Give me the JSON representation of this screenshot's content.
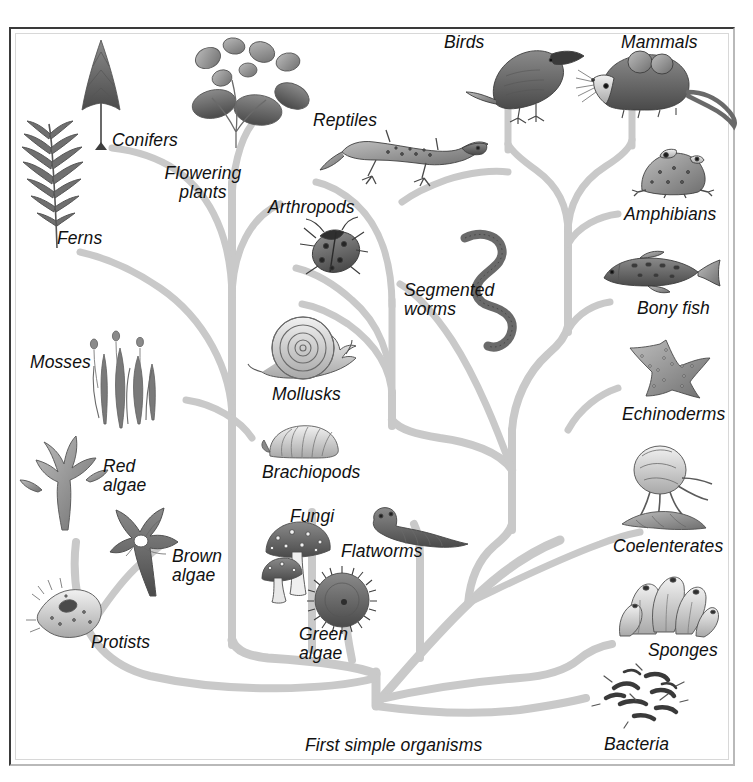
{
  "diagram": {
    "root_label": "First simple organisms",
    "background_color": "#ffffff",
    "branch_color": "#c9c9c9",
    "text_color": "#111111",
    "frame_color_dark": "#3a3a3a",
    "frame_color_light": "#b9b9b9"
  },
  "labels": [
    {
      "id": "conifers",
      "text": "Conifers",
      "x": 112,
      "y": 131,
      "align": "left"
    },
    {
      "id": "flowering",
      "text": "Flowering\nplants",
      "x": 148,
      "y": 164,
      "align": "left"
    },
    {
      "id": "ferns",
      "text": "Ferns",
      "x": 57,
      "y": 229,
      "align": "left"
    },
    {
      "id": "mosses",
      "text": "Mosses",
      "x": 30,
      "y": 353,
      "align": "left"
    },
    {
      "id": "red-algae",
      "text": "Red\nalgae",
      "x": 103,
      "y": 457,
      "align": "left"
    },
    {
      "id": "brown-algae",
      "text": "Brown\nalgae",
      "x": 172,
      "y": 547,
      "align": "left"
    },
    {
      "id": "protists",
      "text": "Protists",
      "x": 91,
      "y": 633,
      "align": "left"
    },
    {
      "id": "arthropods",
      "text": "Arthropods",
      "x": 268,
      "y": 198,
      "align": "left"
    },
    {
      "id": "mollusks",
      "text": "Mollusks",
      "x": 272,
      "y": 385,
      "align": "left"
    },
    {
      "id": "brachiopods",
      "text": "Brachiopods",
      "x": 262,
      "y": 463,
      "align": "left"
    },
    {
      "id": "fungi",
      "text": "Fungi",
      "x": 290,
      "y": 507,
      "align": "left"
    },
    {
      "id": "flatworms",
      "text": "Flatworms",
      "x": 341,
      "y": 542,
      "align": "left"
    },
    {
      "id": "green-algae",
      "text": "Green\nalgae",
      "x": 299,
      "y": 625,
      "align": "left"
    },
    {
      "id": "reptiles",
      "text": "Reptiles",
      "x": 313,
      "y": 111,
      "align": "left"
    },
    {
      "id": "segmented-worms",
      "text": "Segmented\nworms",
      "x": 404,
      "y": 281,
      "align": "left"
    },
    {
      "id": "birds",
      "text": "Birds",
      "x": 444,
      "y": 33,
      "align": "left"
    },
    {
      "id": "mammals",
      "text": "Mammals",
      "x": 621,
      "y": 33,
      "align": "left"
    },
    {
      "id": "amphibians",
      "text": "Amphibians",
      "x": 624,
      "y": 205,
      "align": "left"
    },
    {
      "id": "bony-fish",
      "text": "Bony fish",
      "x": 637,
      "y": 299,
      "align": "left"
    },
    {
      "id": "echinoderms",
      "text": "Echinoderms",
      "x": 622,
      "y": 405,
      "align": "left"
    },
    {
      "id": "coelenterates",
      "text": "Coelenterates",
      "x": 613,
      "y": 537,
      "align": "left"
    },
    {
      "id": "sponges",
      "text": "Sponges",
      "x": 648,
      "y": 641,
      "align": "left"
    },
    {
      "id": "bacteria",
      "text": "Bacteria",
      "x": 604,
      "y": 735,
      "align": "left"
    },
    {
      "id": "first-organisms",
      "text": "First simple organisms",
      "x": 305,
      "y": 736,
      "align": "left"
    }
  ],
  "organisms": [
    {
      "id": "fern",
      "label": "Ferns"
    },
    {
      "id": "conifer",
      "label": "Conifers"
    },
    {
      "id": "flower",
      "label": "Flowering plants"
    },
    {
      "id": "moss",
      "label": "Mosses"
    },
    {
      "id": "red-alga",
      "label": "Red algae"
    },
    {
      "id": "brown-alga",
      "label": "Brown algae"
    },
    {
      "id": "protist",
      "label": "Protists"
    },
    {
      "id": "ladybug",
      "label": "Arthropods"
    },
    {
      "id": "snail",
      "label": "Mollusks"
    },
    {
      "id": "brachiopod",
      "label": "Brachiopods"
    },
    {
      "id": "mushroom",
      "label": "Fungi"
    },
    {
      "id": "flatworm",
      "label": "Flatworms"
    },
    {
      "id": "green-alga",
      "label": "Green algae"
    },
    {
      "id": "earthworm",
      "label": "Segmented worms"
    },
    {
      "id": "lizard",
      "label": "Reptiles"
    },
    {
      "id": "bird",
      "label": "Birds"
    },
    {
      "id": "mouse",
      "label": "Mammals"
    },
    {
      "id": "frog",
      "label": "Amphibians"
    },
    {
      "id": "fish",
      "label": "Bony fish"
    },
    {
      "id": "starfish",
      "label": "Echinoderms"
    },
    {
      "id": "jellyfish",
      "label": "Coelenterates"
    },
    {
      "id": "sponge",
      "label": "Sponges"
    },
    {
      "id": "bacterium",
      "label": "Bacteria"
    }
  ]
}
